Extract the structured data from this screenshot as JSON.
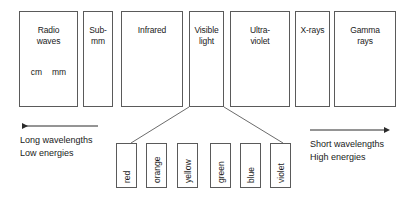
{
  "figure": {
    "stroke_color": "#5a5a5a",
    "text_color": "#1a1a1a",
    "background": "#ffffff"
  },
  "bands": [
    {
      "label": "Radio\nwaves",
      "units": [
        "cm",
        "mm"
      ],
      "x": 19,
      "y": 11,
      "w": 59,
      "h": 96
    },
    {
      "label": "Sub-\nmm",
      "units": [],
      "x": 83,
      "y": 11,
      "w": 30,
      "h": 96
    },
    {
      "label": "Infrared",
      "units": [],
      "x": 121,
      "y": 11,
      "w": 62,
      "h": 96
    },
    {
      "label": "Visible\nlight",
      "units": [],
      "x": 189,
      "y": 11,
      "w": 35,
      "h": 96
    },
    {
      "label": "Ultra-\nviolet",
      "units": [],
      "x": 230,
      "y": 11,
      "w": 60,
      "h": 96
    },
    {
      "label": "X-rays",
      "units": [],
      "x": 295,
      "y": 11,
      "w": 35,
      "h": 96
    },
    {
      "label": "Gamma\nrays",
      "units": [],
      "x": 334,
      "y": 11,
      "w": 62,
      "h": 96
    }
  ],
  "visible_colors": [
    {
      "label": "red",
      "x": 116,
      "y": 143,
      "w": 21,
      "h": 45
    },
    {
      "label": "orange",
      "x": 146,
      "y": 143,
      "w": 21,
      "h": 45
    },
    {
      "label": "yellow",
      "x": 177,
      "y": 143,
      "w": 21,
      "h": 45
    },
    {
      "label": "green",
      "x": 210,
      "y": 143,
      "w": 21,
      "h": 45
    },
    {
      "label": "blue",
      "x": 240,
      "y": 143,
      "w": 21,
      "h": 45
    },
    {
      "label": "violet",
      "x": 270,
      "y": 143,
      "w": 21,
      "h": 45
    }
  ],
  "captions": {
    "left": "Long wavelengths\nLow energies",
    "right": "Short wavelengths\nHigh energies"
  },
  "arrows": {
    "left": {
      "direction": "left",
      "x1": 98,
      "y1": 126,
      "x2": 20,
      "y2": 126
    },
    "right": {
      "direction": "right",
      "x1": 310,
      "y1": 130,
      "x2": 387,
      "y2": 130
    }
  },
  "leader_lines": [
    {
      "name": "visible-to-red",
      "x1": 189,
      "y1": 107,
      "x2": 131,
      "y2": 143
    },
    {
      "name": "visible-to-violet",
      "x1": 224,
      "y1": 107,
      "x2": 283,
      "y2": 143
    }
  ]
}
